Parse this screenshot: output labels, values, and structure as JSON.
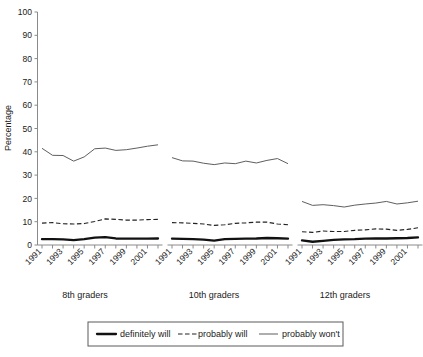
{
  "chart_data": {
    "type": "line",
    "title": "",
    "subtitle": "",
    "xlabel": "",
    "ylabel": "Percentage",
    "ylim": [
      0,
      100
    ],
    "ytick_labels": [
      "0",
      "10",
      "20",
      "30",
      "40",
      "50",
      "60",
      "70",
      "80",
      "90",
      "100"
    ],
    "ytick_values": [
      0,
      10,
      20,
      30,
      40,
      50,
      60,
      70,
      80,
      90,
      100
    ],
    "grid": false,
    "legend_position": "bottom",
    "legend": [
      {
        "name": "definitely will",
        "style": "solid-thick"
      },
      {
        "name": "probably will",
        "style": "dashed"
      },
      {
        "name": "probably won't",
        "style": "solid-thin"
      }
    ],
    "panels": [
      {
        "group_label": "8th graders",
        "x": [
          1991,
          1992,
          1993,
          1994,
          1995,
          1996,
          1997,
          1998,
          1999,
          2000,
          2001,
          2002
        ],
        "xtick_labels": [
          "1991",
          "1993",
          "1995",
          "1997",
          "1999",
          "2001"
        ],
        "series": [
          {
            "name": "definitely will",
            "values": [
              2.5,
              2.5,
              2.4,
              2.1,
              2.5,
              3.2,
              3.4,
              2.8,
              2.7,
              2.7,
              2.7,
              2.8
            ]
          },
          {
            "name": "probably will",
            "values": [
              9.4,
              9.6,
              9.1,
              9.0,
              9.2,
              10.1,
              11.2,
              11.0,
              10.7,
              10.7,
              10.9,
              11.0
            ]
          },
          {
            "name": "probably won't",
            "values": [
              41.5,
              38.5,
              38.4,
              36.0,
              37.8,
              41.3,
              41.6,
              40.6,
              40.9,
              41.6,
              42.4,
              43.0
            ]
          }
        ]
      },
      {
        "group_label": "10th graders",
        "x": [
          1991,
          1992,
          1993,
          1994,
          1995,
          1996,
          1997,
          1998,
          1999,
          2000,
          2001,
          2002
        ],
        "xtick_labels": [
          "1991",
          "1993",
          "1995",
          "1997",
          "1999",
          "2001"
        ],
        "series": [
          {
            "name": "definitely will",
            "values": [
              2.7,
              2.6,
              2.5,
              2.3,
              1.9,
              2.5,
              2.6,
              2.7,
              2.8,
              3.0,
              2.9,
              2.7
            ]
          },
          {
            "name": "probably will",
            "values": [
              9.6,
              9.5,
              9.3,
              9.0,
              8.4,
              8.7,
              9.3,
              9.5,
              9.8,
              9.8,
              9.0,
              8.7
            ]
          },
          {
            "name": "probably won't",
            "values": [
              37.5,
              36.1,
              36.0,
              35.1,
              34.5,
              35.2,
              34.9,
              36.0,
              35.2,
              36.3,
              37.1,
              34.9
            ]
          }
        ]
      },
      {
        "group_label": "12th graders",
        "x": [
          1991,
          1992,
          1993,
          1994,
          1995,
          1996,
          1997,
          1998,
          1999,
          2000,
          2001,
          2002
        ],
        "xtick_labels": [
          "1991",
          "1993",
          "1995",
          "1997",
          "1999",
          "2001"
        ],
        "series": [
          {
            "name": "definitely will",
            "values": [
              2.0,
              1.4,
              1.8,
              2.2,
              2.4,
              2.5,
              2.7,
              2.8,
              2.8,
              2.9,
              3.0,
              3.3
            ]
          },
          {
            "name": "probably will",
            "values": [
              5.7,
              5.4,
              6.0,
              5.8,
              5.8,
              6.3,
              6.5,
              6.9,
              6.8,
              6.3,
              6.7,
              7.4
            ]
          },
          {
            "name": "probably won't",
            "values": [
              18.7,
              17.0,
              17.3,
              16.9,
              16.3,
              17.1,
              17.6,
              18.0,
              18.7,
              17.6,
              18.1,
              18.8
            ]
          }
        ]
      }
    ]
  }
}
